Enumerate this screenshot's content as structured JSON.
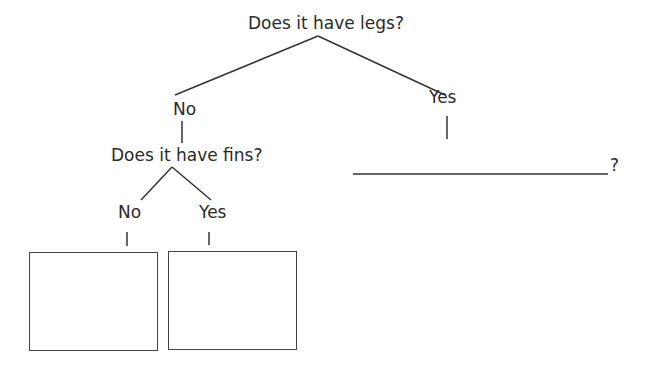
{
  "diagram": {
    "type": "decision-tree",
    "root_question": "Does it have legs?",
    "branches": {
      "no": {
        "label": "No",
        "question": "Does it have fins?",
        "branches": {
          "no": {
            "label": "No",
            "answer_box": ""
          },
          "yes": {
            "label": "Yes",
            "answer_box": ""
          }
        }
      },
      "yes": {
        "label": "Yes",
        "blank_question_suffix": "?"
      }
    },
    "line_color": "#333333"
  }
}
